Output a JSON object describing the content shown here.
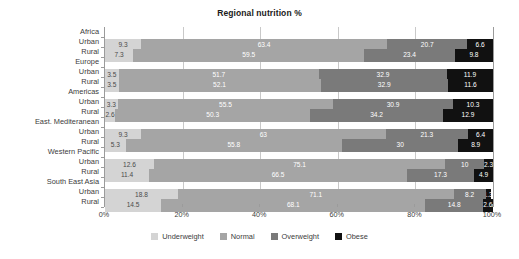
{
  "chart_data": {
    "type": "bar",
    "subtype": "stacked-horizontal-100pct",
    "title": "Regional nutrition %",
    "xlabel": "",
    "ylabel": "",
    "xlim": [
      0,
      100
    ],
    "xticks": [
      "0%",
      "20%",
      "40%",
      "60%",
      "80%",
      "100%"
    ],
    "xtick_values": [
      0,
      20,
      40,
      60,
      80,
      100
    ],
    "grid": true,
    "legend_position": "bottom",
    "legend": [
      "Underweight",
      "Normal",
      "Overweight",
      "Obese"
    ],
    "series": [
      {
        "name": "Underweight",
        "color": "#d4d4d4",
        "values": [
          9.3,
          7.3,
          3.5,
          3.5,
          3.3,
          2.6,
          9.3,
          5.3,
          12.6,
          11.4,
          18.8,
          14.5
        ]
      },
      {
        "name": "Normal",
        "color": "#a5a5a5",
        "values": [
          63.4,
          59.5,
          51.7,
          52.1,
          55.5,
          50.3,
          63.0,
          55.8,
          75.1,
          66.5,
          71.1,
          68.1
        ]
      },
      {
        "name": "Overweight",
        "color": "#7a7a7a",
        "values": [
          20.7,
          23.4,
          32.9,
          32.9,
          30.9,
          34.2,
          21.3,
          30.0,
          10.0,
          17.3,
          8.2,
          14.8
        ]
      },
      {
        "name": "Obese",
        "color": "#111111",
        "values": [
          6.6,
          9.8,
          11.9,
          11.6,
          10.3,
          12.9,
          6.4,
          8.9,
          2.3,
          4.9,
          1.3,
          2.6
        ]
      }
    ],
    "groups": [
      {
        "label": "Africa"
      },
      {
        "label": "Urban"
      },
      {
        "label": "Rural"
      },
      {
        "label": "Europe"
      },
      {
        "label": "Urban"
      },
      {
        "label": "Rural"
      },
      {
        "label": "Americas"
      },
      {
        "label": "Urban"
      },
      {
        "label": "Rural"
      },
      {
        "label": "East. Mediteranean"
      },
      {
        "label": "Urban"
      },
      {
        "label": "Rural"
      },
      {
        "label": "Western Pacific"
      },
      {
        "label": "Urban"
      },
      {
        "label": "Rural"
      },
      {
        "label": "South East Asia"
      },
      {
        "label": "Urban"
      },
      {
        "label": "Rural"
      }
    ],
    "categories": [
      "Africa Urban",
      "Africa Rural",
      "Europe Urban",
      "Europe Rural",
      "Americas Urban",
      "Americas Rural",
      "East. Mediteranean Urban",
      "East. Mediteranean Rural",
      "Western Pacific Urban",
      "Western Pacific Rural",
      "South East Asia Urban",
      "South East Asia Rural"
    ],
    "rows": [
      {
        "region": "Africa",
        "setting": "Urban",
        "underweight": 9.3,
        "normal": 63.4,
        "overweight": 20.7,
        "obese": 6.6
      },
      {
        "region": "Africa",
        "setting": "Rural",
        "underweight": 7.3,
        "normal": 59.5,
        "overweight": 23.4,
        "obese": 9.8
      },
      {
        "region": "Europe",
        "setting": "Urban",
        "underweight": 3.5,
        "normal": 51.7,
        "overweight": 32.9,
        "obese": 11.9
      },
      {
        "region": "Europe",
        "setting": "Rural",
        "underweight": 3.5,
        "normal": 52.1,
        "overweight": 32.9,
        "obese": 11.6
      },
      {
        "region": "Americas",
        "setting": "Urban",
        "underweight": 3.3,
        "normal": 55.5,
        "overweight": 30.9,
        "obese": 10.3
      },
      {
        "region": "Americas",
        "setting": "Rural",
        "underweight": 2.6,
        "normal": 50.3,
        "overweight": 34.2,
        "obese": 12.9
      },
      {
        "region": "East. Mediteranean",
        "setting": "Urban",
        "underweight": 9.3,
        "normal": 63.0,
        "overweight": 21.3,
        "obese": 6.4
      },
      {
        "region": "East. Mediteranean",
        "setting": "Rural",
        "underweight": 5.3,
        "normal": 55.8,
        "overweight": 30.0,
        "obese": 8.9
      },
      {
        "region": "Western Pacific",
        "setting": "Urban",
        "underweight": 12.6,
        "normal": 75.1,
        "overweight": 10.0,
        "obese": 2.3
      },
      {
        "region": "Western Pacific",
        "setting": "Rural",
        "underweight": 11.4,
        "normal": 66.5,
        "overweight": 17.3,
        "obese": 4.9
      },
      {
        "region": "South East Asia",
        "setting": "Urban",
        "underweight": 18.8,
        "normal": 71.1,
        "overweight": 8.2,
        "obese": 1.3
      },
      {
        "region": "South East Asia",
        "setting": "Rural",
        "underweight": 14.5,
        "normal": 68.1,
        "overweight": 14.8,
        "obese": 2.6
      }
    ],
    "labels": {
      "underweight": [
        "9.3",
        "7.3",
        "3.5",
        "3.5",
        "3.3",
        "2.6",
        "9.3",
        "5.3",
        "12.6",
        "11.4",
        "18.8",
        "14.5"
      ],
      "normal": [
        "63.4",
        "59.5",
        "51.7",
        "52.1",
        "55.5",
        "50.3",
        "63",
        "55.8",
        "75.1",
        "66.5",
        "71.1",
        "68.1"
      ],
      "overweight": [
        "20.7",
        "23.4",
        "32.9",
        "32.9",
        "30.9",
        "34.2",
        "21.3",
        "30",
        "10",
        "17.3",
        "8.2",
        "14.8"
      ],
      "obese": [
        "6.6",
        "9.8",
        "11.9",
        "11.6",
        "10.3",
        "12.9",
        "6.4",
        "8.9",
        "2.3",
        "4.9",
        "1.3",
        "2.6"
      ]
    }
  },
  "colors": {
    "underweight": "#d4d4d4",
    "normal": "#a5a5a5",
    "overweight": "#7a7a7a",
    "obese": "#111111",
    "grid": "#c9c9c9",
    "axis": "#9b9b9b",
    "text": "#3b3b3b",
    "title": "#1a1a1a",
    "background": "#ffffff"
  }
}
